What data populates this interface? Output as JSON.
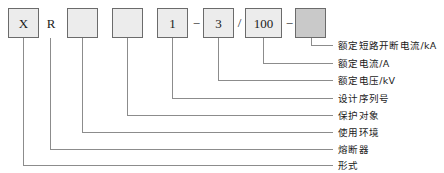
{
  "diagram": {
    "type": "model-designation-callout",
    "line_color": "#8c8c8c",
    "box_border_color": "#6b6b6b",
    "box_fill_color": "#ececec",
    "box_fill_dark_color": "#c9c9c9",
    "text_color": "#1a1a1a"
  },
  "code": {
    "segments": [
      {
        "id": "seg1",
        "kind": "box",
        "value": "X",
        "x": 8,
        "y": 8,
        "w": 31,
        "h": 30,
        "filled": false
      },
      {
        "id": "seg2",
        "kind": "char",
        "value": "R",
        "x": 44,
        "y": 17,
        "w": 14
      },
      {
        "id": "seg3",
        "kind": "box",
        "value": "",
        "x": 67,
        "y": 8,
        "w": 31,
        "h": 30,
        "filled": false
      },
      {
        "id": "seg4",
        "kind": "box",
        "value": "",
        "x": 112,
        "y": 8,
        "w": 31,
        "h": 30,
        "filled": false
      },
      {
        "id": "seg5",
        "kind": "box",
        "value": "1",
        "x": 157,
        "y": 8,
        "w": 31,
        "h": 30,
        "filled": false
      },
      {
        "id": "sep1",
        "kind": "separator",
        "value": "−",
        "x": 190,
        "y": 17,
        "w": 13
      },
      {
        "id": "seg6",
        "kind": "box",
        "value": "3",
        "x": 203,
        "y": 8,
        "w": 31,
        "h": 30,
        "filled": false
      },
      {
        "id": "sep2",
        "kind": "separator",
        "value": "/",
        "x": 234,
        "y": 16,
        "w": 11
      },
      {
        "id": "seg7",
        "kind": "box",
        "value": "100",
        "x": 245,
        "y": 8,
        "w": 37,
        "h": 30,
        "filled": false
      },
      {
        "id": "sep3",
        "kind": "separator",
        "value": "−",
        "x": 283,
        "y": 17,
        "w": 13
      },
      {
        "id": "seg8",
        "kind": "box",
        "value": "",
        "x": 295,
        "y": 8,
        "w": 31,
        "h": 30,
        "filled": true
      }
    ]
  },
  "callouts": [
    {
      "id": "c1",
      "label": "额定短路开断电流/kA",
      "stem_x": 311,
      "elbow_y": 45,
      "text_x": 338,
      "text_y": 41
    },
    {
      "id": "c2",
      "label": "额定电流/A",
      "stem_x": 263,
      "elbow_y": 63,
      "text_x": 338,
      "text_y": 59
    },
    {
      "id": "c3",
      "label": "额定电压/kV",
      "stem_x": 218,
      "elbow_y": 80,
      "text_x": 338,
      "text_y": 76
    },
    {
      "id": "c4",
      "label": "设计序列号",
      "stem_x": 172,
      "elbow_y": 98,
      "text_x": 338,
      "text_y": 94
    },
    {
      "id": "c5",
      "label": "保护对象",
      "stem_x": 127,
      "elbow_y": 115,
      "text_x": 338,
      "text_y": 111
    },
    {
      "id": "c6",
      "label": "使用环境",
      "stem_x": 82,
      "elbow_y": 132,
      "text_x": 338,
      "text_y": 128
    },
    {
      "id": "c7",
      "label": "熔断器",
      "stem_x": 50,
      "elbow_y": 149,
      "text_x": 338,
      "text_y": 145
    },
    {
      "id": "c8",
      "label": "形式",
      "stem_x": 23,
      "elbow_y": 165,
      "text_x": 338,
      "text_y": 161
    }
  ],
  "geometry": {
    "stem_top_y": 38,
    "line_end_x": 333,
    "canvas_width": 444,
    "canvas_height": 173
  }
}
